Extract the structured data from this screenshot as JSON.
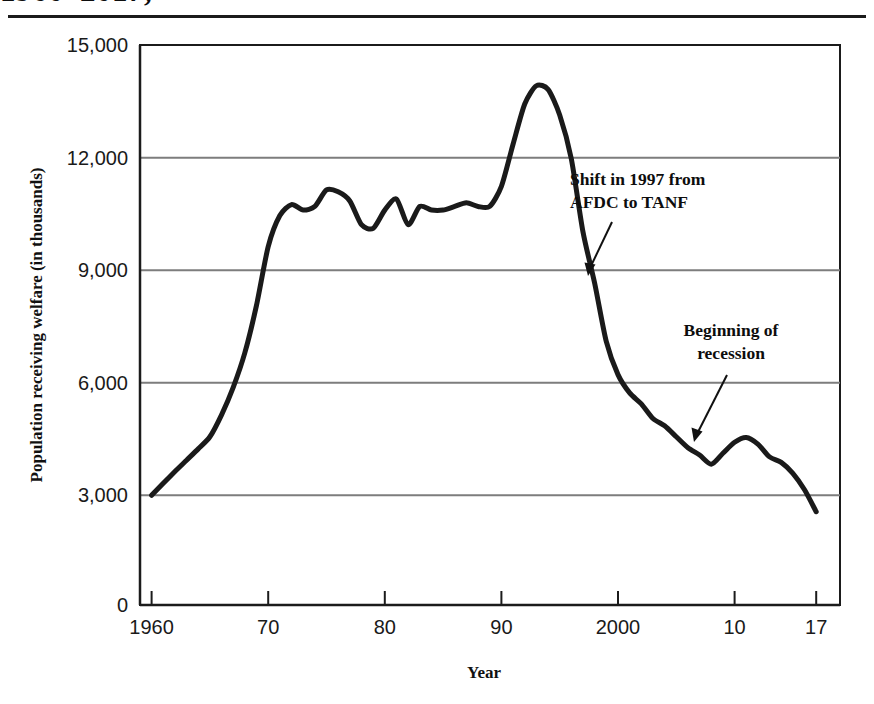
{
  "figure": {
    "title_partial": "1960–2017,",
    "title_note": "title line is clipped at the top edge of the screenshot"
  },
  "chart_data": {
    "type": "line",
    "title": "1960–2017,",
    "xlabel": "Year",
    "ylabel": "Population receiving welfare (in thousands)",
    "xlim": [
      1960,
      2017
    ],
    "ylim": [
      0,
      15000
    ],
    "grid": "horizontal",
    "legend": "none",
    "x_tick_values": [
      1960,
      1970,
      1980,
      1990,
      2000,
      2010,
      2017
    ],
    "x_tick_labels": [
      "1960",
      "70",
      "80",
      "90",
      "2000",
      "10",
      "17"
    ],
    "y_tick_values": [
      0,
      3000,
      6000,
      9000,
      12000,
      15000
    ],
    "y_tick_labels": [
      "0",
      "3,000",
      "6,000",
      "9,000",
      "12,000",
      "15,000"
    ],
    "line_color": "#1a1a1a",
    "line_width": 5,
    "series": [
      {
        "name": "Population receiving welfare",
        "x": [
          1960,
          1961,
          1962,
          1963,
          1964,
          1965,
          1966,
          1967,
          1968,
          1969,
          1970,
          1971,
          1972,
          1973,
          1974,
          1975,
          1976,
          1977,
          1978,
          1979,
          1980,
          1981,
          1982,
          1983,
          1984,
          1985,
          1986,
          1987,
          1988,
          1989,
          1990,
          1991,
          1992,
          1993,
          1994,
          1995,
          1996,
          1997,
          1998,
          1999,
          2000,
          2001,
          2002,
          2003,
          2004,
          2005,
          2006,
          2007,
          2008,
          2009,
          2010,
          2011,
          2012,
          2013,
          2014,
          2015,
          2016,
          2017
        ],
        "values": [
          3000,
          3330,
          3650,
          3960,
          4270,
          4600,
          5200,
          5950,
          6900,
          8200,
          9800,
          10650,
          10950,
          10800,
          10900,
          11350,
          11300,
          11050,
          10400,
          10300,
          10800,
          11100,
          10400,
          10900,
          10800,
          10800,
          10900,
          11000,
          10900,
          10900,
          11450,
          12600,
          13700,
          14200,
          14100,
          13400,
          12200,
          10200,
          8800,
          7200,
          6300,
          5800,
          5500,
          5100,
          4900,
          4600,
          4300,
          4100,
          3850,
          4150,
          4450,
          4580,
          4400,
          4050,
          3900,
          3600,
          3150,
          2550
        ]
      }
    ],
    "annotations": [
      {
        "id": "shift-1997",
        "text_lines": [
          "Shift in 1997 from",
          "AFDC to TANF"
        ],
        "points_to_year": 1997,
        "points_to_value": 8800
      },
      {
        "id": "recession-start",
        "text_lines": [
          "Beginning of",
          "recession"
        ],
        "points_to_year": 2008,
        "points_to_value": 3850
      }
    ]
  }
}
